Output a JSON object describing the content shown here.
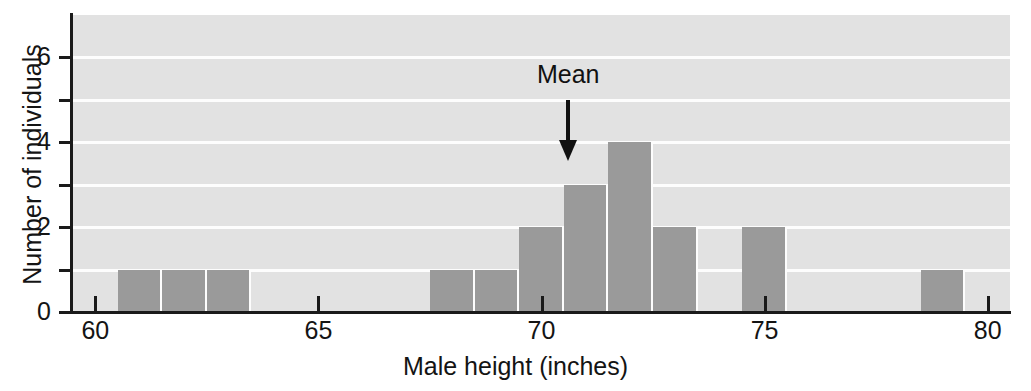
{
  "chart_data": {
    "type": "bar",
    "title": "",
    "subtitle": "",
    "xlabel": "Male height (inches)",
    "ylabel": "Number of individuals",
    "xlim": [
      59.5,
      80.5
    ],
    "ylim": [
      0,
      7
    ],
    "grid": true,
    "legend": null,
    "bin_width": 1,
    "x_ticks": [
      60,
      65,
      70,
      75,
      80
    ],
    "x_tick_labels": [
      "60",
      "65",
      "70",
      "75",
      "80"
    ],
    "y_ticks": [
      0,
      1,
      2,
      3,
      4,
      5,
      6
    ],
    "y_tick_labels": [
      "0",
      "",
      "2",
      "",
      "4",
      "",
      "6"
    ],
    "y_major_labels": [
      "0",
      "2",
      "4",
      "6"
    ],
    "bins": [
      {
        "start": 60.5,
        "end": 61.5,
        "count": 1
      },
      {
        "start": 61.5,
        "end": 62.5,
        "count": 1
      },
      {
        "start": 62.5,
        "end": 63.5,
        "count": 1
      },
      {
        "start": 67.5,
        "end": 68.5,
        "count": 1
      },
      {
        "start": 68.5,
        "end": 69.5,
        "count": 1
      },
      {
        "start": 69.5,
        "end": 70.5,
        "count": 2
      },
      {
        "start": 70.5,
        "end": 71.5,
        "count": 3
      },
      {
        "start": 71.5,
        "end": 72.5,
        "count": 4
      },
      {
        "start": 72.5,
        "end": 73.5,
        "count": 2
      },
      {
        "start": 74.5,
        "end": 75.5,
        "count": 2
      },
      {
        "start": 78.5,
        "end": 79.5,
        "count": 1
      }
    ],
    "categories": [
      "61",
      "62",
      "63",
      "68",
      "69",
      "70",
      "71",
      "72",
      "73",
      "75",
      "79"
    ],
    "values": [
      1,
      1,
      1,
      1,
      1,
      2,
      3,
      4,
      2,
      2,
      1
    ],
    "annotations": [
      {
        "name": "mean-marker",
        "label": "Mean",
        "x": 70.6,
        "style": "down-arrow"
      }
    ],
    "colors": {
      "bar_fill": "#9a9a9a",
      "plot_background": "#e2e2e2",
      "gridline": "#fdfdfd",
      "axis": "#1a1a1a",
      "text": "#141414"
    }
  }
}
